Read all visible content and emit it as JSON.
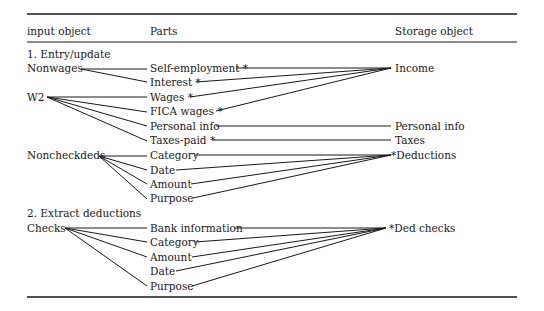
{
  "table": {
    "headers": {
      "input_object": "input object",
      "parts": "Parts",
      "storage_object": "Storage object"
    },
    "sections": [
      {
        "title": "1. Entry/update",
        "inputs": [
          "Nonwages",
          "W2",
          "Noncheckdeds"
        ],
        "parts": [
          "Self-employment *",
          "Interest *",
          "Wages *",
          "FICA wages *",
          "Personal info",
          "Taxes-paid *",
          "Category",
          "Date",
          "Amount",
          "Purpose"
        ],
        "storage": [
          "Income",
          "Personal info",
          "Taxes",
          "*Deductions"
        ]
      },
      {
        "title": "2. Extract deductions",
        "inputs": [
          "Checks"
        ],
        "parts": [
          "Bank information",
          "Category",
          "Amount",
          "Date",
          "Purpose"
        ],
        "storage": [
          "*Ded checks"
        ]
      }
    ],
    "connections": [
      {
        "from": "Nonwages",
        "to": [
          "Self-employment *",
          "Interest *"
        ]
      },
      {
        "from": "W2",
        "to": [
          "Wages *",
          "FICA wages *",
          "Personal info",
          "Taxes-paid *"
        ]
      },
      {
        "from": "Noncheckdeds",
        "to": [
          "Category",
          "Date",
          "Amount",
          "Purpose"
        ]
      },
      {
        "from": "Checks",
        "to": [
          "Bank information",
          "Category",
          "Amount",
          "Purpose"
        ]
      },
      {
        "to": "Income",
        "from": [
          "Self-employment *",
          "Interest *",
          "Wages *",
          "FICA wages *"
        ]
      },
      {
        "to": "Personal info",
        "from": [
          "Personal info"
        ]
      },
      {
        "to": "Taxes",
        "from": [
          "Taxes-paid *"
        ]
      },
      {
        "to": "*Deductions",
        "from": [
          "Category",
          "Date",
          "Amount",
          "Purpose"
        ]
      },
      {
        "to": "*Ded checks",
        "from": [
          "Bank information",
          "Category",
          "Amount",
          "Date",
          "Purpose"
        ]
      }
    ]
  }
}
